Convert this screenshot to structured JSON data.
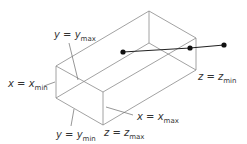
{
  "diagram": {
    "type": "3d-bounding-box",
    "colors": {
      "edges": "#8a8a8a",
      "ray": "#222222",
      "text": "#333333"
    },
    "vertices": {
      "back_top": [
        149,
        11
      ],
      "right_top": [
        196,
        38
      ],
      "right_bottom": [
        196,
        70
      ],
      "back_bottom": [
        149,
        43
      ],
      "left_top": [
        56,
        66
      ],
      "left_bottom": [
        56,
        98
      ],
      "front_top": [
        103,
        92
      ],
      "front_bottom": [
        103,
        125
      ]
    },
    "ray_points": [
      [
        123,
        52
      ],
      [
        190,
        48
      ],
      [
        224,
        45
      ]
    ],
    "labels": {
      "y_max": {
        "var": "y = y",
        "sub": "max"
      },
      "x_min": {
        "var": "x = x",
        "sub": "min"
      },
      "y_min": {
        "var": "y = y",
        "sub": "min"
      },
      "z_max": {
        "var": "z = z",
        "sub": "max"
      },
      "x_max": {
        "var": "x = x",
        "sub": "max"
      },
      "z_min": {
        "var": "z = z",
        "sub": "min"
      }
    }
  }
}
